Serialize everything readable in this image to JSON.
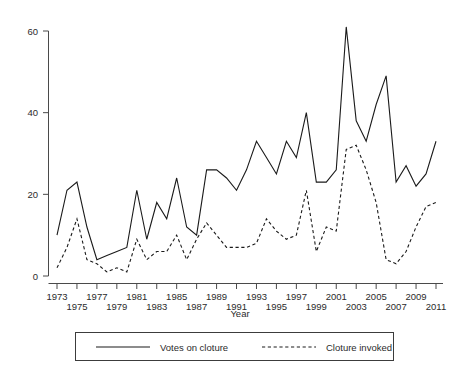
{
  "chart_data": {
    "type": "line",
    "title": "",
    "subtitle": "",
    "xlabel": "Year",
    "ylabel": "",
    "xlim": [
      1973,
      2011
    ],
    "ylim": [
      0,
      62
    ],
    "grid": false,
    "legend_position": "bottom",
    "x": [
      1973,
      1974,
      1975,
      1976,
      1977,
      1978,
      1979,
      1980,
      1981,
      1982,
      1983,
      1984,
      1985,
      1986,
      1987,
      1988,
      1989,
      1990,
      1991,
      1992,
      1993,
      1994,
      1995,
      1996,
      1997,
      1998,
      1999,
      2000,
      2001,
      2002,
      2003,
      2004,
      2005,
      2006,
      2007,
      2008,
      2009,
      2010,
      2011
    ],
    "series": [
      {
        "name": "Votes on cloture",
        "style": "solid",
        "values": [
          10,
          21,
          23,
          12,
          4,
          5,
          6,
          7,
          21,
          9,
          18,
          14,
          24,
          12,
          10,
          26,
          26,
          24,
          21,
          26,
          33,
          29,
          25,
          33,
          29,
          40,
          23,
          23,
          26,
          61,
          38,
          33,
          42,
          49,
          23,
          27,
          22,
          25,
          33
        ]
      },
      {
        "name": "Cloture invoked",
        "style": "dashed",
        "values": [
          2,
          7,
          14,
          4,
          3,
          1,
          2,
          1,
          9,
          4,
          6,
          6,
          10,
          4,
          9,
          13,
          10,
          7,
          7,
          7,
          8,
          14,
          11,
          9,
          10,
          21,
          6,
          12,
          11,
          31,
          32,
          26,
          18,
          4,
          3,
          6,
          12,
          17,
          18
        ]
      }
    ],
    "y_ticks": [
      0,
      20,
      40,
      60
    ],
    "x_ticks": [
      1973,
      1975,
      1977,
      1979,
      1981,
      1983,
      1985,
      1987,
      1989,
      1991,
      1993,
      1995,
      1997,
      1999,
      2001,
      2003,
      2005,
      2007,
      2009,
      2011
    ],
    "x_tick_row_top": [
      1973,
      1977,
      1981,
      1985,
      1989,
      1993,
      1997,
      2001,
      2005,
      2009
    ],
    "x_tick_row_bottom": [
      1975,
      1979,
      1983,
      1987,
      1991,
      1995,
      1999,
      2003,
      2007,
      2011
    ]
  },
  "legend": {
    "items": [
      {
        "label": "Votes on cloture",
        "style": "solid"
      },
      {
        "label": "Cloture invoked",
        "style": "dashed"
      }
    ]
  },
  "axes": {
    "x_title": "Year"
  },
  "colors": {
    "ink": "#1a1a1a",
    "axis": "#4a4a4a",
    "background": "#ffffff"
  }
}
